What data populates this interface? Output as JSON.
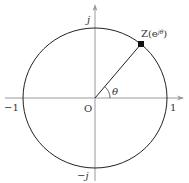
{
  "diagram": {
    "labels": {
      "point": "Z(e",
      "point_sup": "jθ",
      "point_close": ")",
      "origin": "O",
      "angle": "θ",
      "x_pos": "1",
      "x_neg": "−1",
      "y_pos": "j",
      "y_neg": "−j"
    },
    "geometry": {
      "origin": [
        95,
        98
      ],
      "radius_x": 72,
      "radius_y": 70,
      "point": [
        141,
        44
      ],
      "angle_deg": 49
    },
    "colors": {
      "axis": "#9a9a9a",
      "circle": "#222222",
      "text": "#333333"
    }
  }
}
